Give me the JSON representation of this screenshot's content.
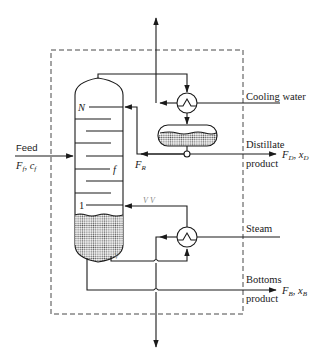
{
  "diagram": {
    "labels": {
      "feed": "Feed",
      "feed_vars": "F",
      "feed_f_sub": "f",
      "feed_c": "c",
      "feed_c_sub": "f",
      "cooling_water": "Cooling water",
      "distillate_line1": "Distillate",
      "distillate_line2": "product",
      "distillate_F": "F",
      "distillate_F_sub": "D",
      "distillate_x": "x",
      "distillate_x_sub": "D",
      "reflux_F": "F",
      "reflux_sub": "R",
      "steam": "Steam",
      "bottoms_line1": "Bottoms",
      "bottoms_line2": "product",
      "bottoms_F": "F",
      "bottoms_F_sub": "B",
      "bottoms_x": "x",
      "bottoms_x_sub": "B",
      "tray_top": "N",
      "tray_feed": "f",
      "tray_bottom": "1",
      "vapor_mark_1": "V",
      "vapor_mark_2": "V",
      "vapor_mark_3": "V"
    },
    "components": [
      "distillation-column",
      "condenser",
      "reflux-drum",
      "reboiler",
      "control-boundary"
    ],
    "streams": [
      {
        "name": "feed",
        "direction": "in"
      },
      {
        "name": "cooling-water",
        "direction": "in"
      },
      {
        "name": "distillate-product",
        "direction": "out"
      },
      {
        "name": "reflux",
        "direction": "internal"
      },
      {
        "name": "steam",
        "direction": "in"
      },
      {
        "name": "bottoms-product",
        "direction": "out"
      },
      {
        "name": "overhead-vent",
        "direction": "out"
      },
      {
        "name": "bottom-drain",
        "direction": "out"
      }
    ],
    "colors": {
      "line": "#1a1a1a",
      "liquid_fill": "#c8c8c8",
      "background": "#ffffff"
    }
  }
}
